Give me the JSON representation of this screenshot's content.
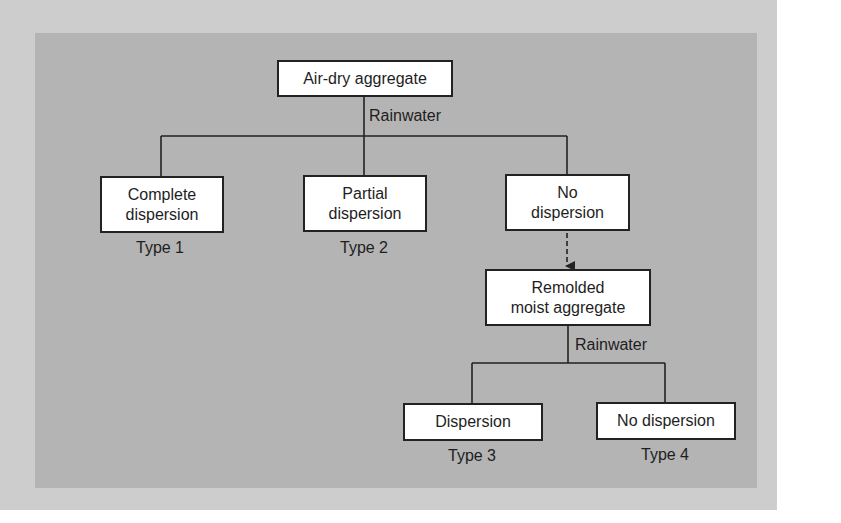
{
  "diagram": {
    "root": {
      "label": "Air-dry aggregate"
    },
    "treatment_1": {
      "label": "Rainwater"
    },
    "level_1": [
      {
        "label": "Complete\ndispersion",
        "type": "Type 1"
      },
      {
        "label": "Partial\ndispersion",
        "type": "Type 2"
      },
      {
        "label": "No\ndispersion",
        "type": ""
      }
    ],
    "remolded": {
      "label": "Remolded\nmoist aggregate"
    },
    "treatment_2": {
      "label": "Rainwater"
    },
    "level_2": [
      {
        "label": "Dispersion",
        "type": "Type 3"
      },
      {
        "label": "No dispersion",
        "type": "Type 4"
      }
    ],
    "colors": {
      "background": "#ffffff",
      "halo": "#cdcdcd",
      "panel": "#b4b4b4",
      "box_fill": "#ffffff",
      "line": "#222222",
      "text": "#1e1e1e"
    }
  }
}
